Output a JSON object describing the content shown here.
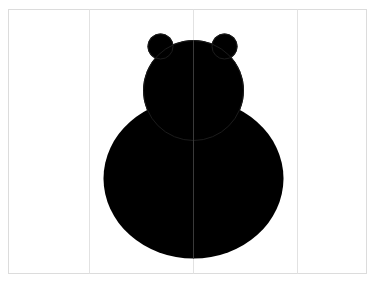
{
  "canvas": {
    "width": 376,
    "height": 299,
    "background": "#ffffff"
  },
  "frame": {
    "x": 8.5,
    "y": 9.5,
    "width": 358,
    "height": 264,
    "stroke": "#dcdcdc"
  },
  "grid_lines": [
    {
      "x": 89.5,
      "stroke": "#e2e2e2"
    },
    {
      "x": 193.5,
      "stroke": "#e2e2e2"
    },
    {
      "x": 297.5,
      "stroke": "#e2e2e2"
    }
  ],
  "figure": {
    "name": "bear-silhouette",
    "fill": "#000000",
    "outline": "#1c1c1c",
    "body": {
      "cx": 193.5,
      "cy": 178.5,
      "rx": 90,
      "ry": 80
    },
    "head": {
      "cx": 193.5,
      "cy": 90.5,
      "r": 50.5
    },
    "ears": [
      {
        "cx": 160.5,
        "cy": 46.5,
        "r": 13
      },
      {
        "cx": 224.5,
        "cy": 46.5,
        "r": 13
      }
    ],
    "center_line_stroke": "#3a3a3a"
  }
}
